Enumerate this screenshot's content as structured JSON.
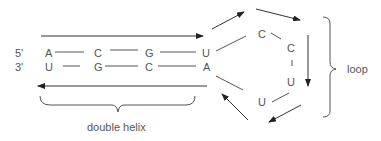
{
  "diagram": {
    "strand_labels": {
      "top": "5'",
      "bottom": "3'"
    },
    "double_helix": {
      "top_strand": [
        "A",
        "C",
        "G",
        "U"
      ],
      "bottom_strand": [
        "U",
        "G",
        "C",
        "A"
      ],
      "label": "double helix"
    },
    "loop": {
      "bases": [
        "C",
        "C",
        "U",
        "U"
      ],
      "label": "loop"
    },
    "colors": {
      "line": "#555555",
      "arrow": "#333333",
      "text": "#555555",
      "background": "#ffffff"
    }
  }
}
